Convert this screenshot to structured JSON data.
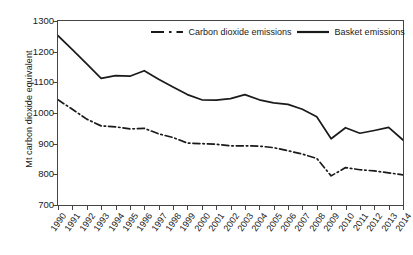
{
  "chart_data": {
    "type": "line",
    "title": "",
    "xlabel": "",
    "ylabel": "Mt carbon dioxide equivalent",
    "ylim": [
      700,
      1300
    ],
    "yticks": [
      700,
      800,
      900,
      1000,
      1100,
      1200,
      1300
    ],
    "grid": false,
    "legend_position": "top",
    "categories": [
      "1990",
      "1991",
      "1992",
      "1993",
      "1994",
      "1995",
      "1996",
      "1997",
      "1998",
      "1999",
      "2000",
      "2001",
      "2002",
      "2003",
      "2004",
      "2005",
      "2006",
      "2007",
      "2008",
      "2009",
      "2010",
      "2011",
      "2012",
      "2013",
      "2014"
    ],
    "series": [
      {
        "name": "Carbon dioxide emissions",
        "style": "dash-dot",
        "values": [
          1043,
          1012,
          980,
          958,
          955,
          948,
          950,
          932,
          920,
          902,
          900,
          898,
          893,
          893,
          892,
          887,
          877,
          866,
          852,
          795,
          822,
          815,
          811,
          805,
          798
        ]
      },
      {
        "name": "Basket emissions",
        "style": "solid",
        "values": [
          1252,
          1207,
          1160,
          1113,
          1122,
          1120,
          1138,
          1110,
          1085,
          1060,
          1043,
          1042,
          1047,
          1060,
          1043,
          1033,
          1028,
          1012,
          988,
          916,
          952,
          934,
          943,
          953,
          912
        ]
      }
    ]
  },
  "axis": {
    "y_label": "Mt carbon dioxide equivalent",
    "y_tick_labels": [
      "1300",
      "1200",
      "1100",
      "1000",
      "900",
      "800",
      "700"
    ],
    "x_tick_labels": [
      "1990",
      "1991",
      "1992",
      "1993",
      "1994",
      "1995",
      "1996",
      "1997",
      "1998",
      "1999",
      "2000",
      "2001",
      "2002",
      "2003",
      "2004",
      "2005",
      "2006",
      "2007",
      "2008",
      "2009",
      "2010",
      "2011",
      "2012",
      "2013",
      "2014"
    ]
  },
  "legend": {
    "items": [
      {
        "label": "Carbon dioxide emissions",
        "style": "dash-dot"
      },
      {
        "label": "Basket emissions",
        "style": "solid"
      }
    ]
  },
  "colors": {
    "line": "#1a1a1a",
    "axis": "#444444",
    "background": "#ffffff"
  }
}
